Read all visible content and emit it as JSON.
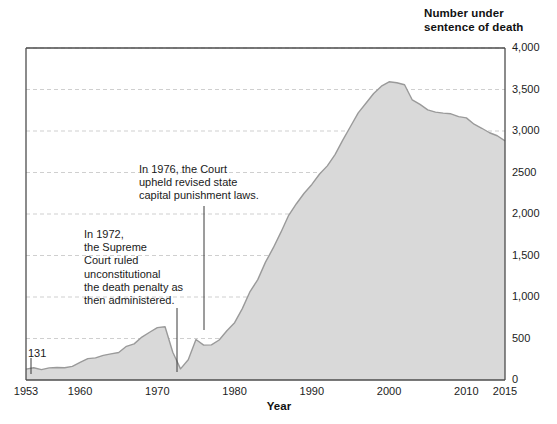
{
  "header": {
    "title": "Number under\nsentence of death"
  },
  "chart_data": {
    "type": "area",
    "title": "Number under sentence of death",
    "xlabel": "Year",
    "ylabel": "Number under sentence of death",
    "xlim": [
      1953,
      2015
    ],
    "ylim": [
      0,
      4000
    ],
    "grid": true,
    "legend": null,
    "x_ticks": [
      "1953",
      "1960",
      "1970",
      "1980",
      "1990",
      "2000",
      "2010",
      "2015"
    ],
    "x_tick_values": [
      1953,
      1960,
      1970,
      1980,
      1990,
      2000,
      2010,
      2015
    ],
    "y_ticks": [
      "0",
      "500",
      "1,000",
      "1,500",
      "2,000",
      "2500",
      "3,000",
      "3,500",
      "4,000"
    ],
    "y_tick_values": [
      0,
      500,
      1000,
      1500,
      2000,
      2500,
      3000,
      3500,
      4000
    ],
    "series_name": "Prisoners under sentence of death",
    "fill_color": "#d9d9d9",
    "line_color": "#9a9a9a",
    "x": [
      1953,
      1954,
      1955,
      1956,
      1957,
      1958,
      1959,
      1960,
      1961,
      1962,
      1963,
      1964,
      1965,
      1966,
      1967,
      1968,
      1969,
      1970,
      1971,
      1972,
      1973,
      1974,
      1975,
      1976,
      1977,
      1978,
      1979,
      1980,
      1981,
      1982,
      1983,
      1984,
      1985,
      1986,
      1987,
      1988,
      1989,
      1990,
      1991,
      1992,
      1993,
      1994,
      1995,
      1996,
      1997,
      1998,
      1999,
      2000,
      2001,
      2002,
      2003,
      2004,
      2005,
      2006,
      2007,
      2008,
      2009,
      2010,
      2011,
      2012,
      2013,
      2014,
      2015
    ],
    "values": [
      131,
      147,
      125,
      146,
      151,
      147,
      164,
      212,
      257,
      267,
      297,
      315,
      331,
      406,
      435,
      517,
      575,
      631,
      642,
      334,
      134,
      244,
      488,
      420,
      423,
      482,
      593,
      691,
      860,
      1066,
      1209,
      1420,
      1591,
      1781,
      1984,
      2124,
      2250,
      2356,
      2482,
      2580,
      2716,
      2890,
      3054,
      3219,
      3335,
      3452,
      3540,
      3593,
      3581,
      3557,
      3374,
      3320,
      3254,
      3228,
      3215,
      3207,
      3173,
      3158,
      3082,
      3033,
      2979,
      2943,
      2881
    ],
    "annotations": [
      {
        "id": "annotation-1972",
        "text": "In 1972,\nthe Supreme\nCourt ruled\nunconstitutional\nthe death penalty as\nthen administered.",
        "points_to_year": 1973
      },
      {
        "id": "annotation-1976",
        "text": "In 1976, the Court\nupheld revised state\ncapital punishment laws.",
        "points_to_year": 1976
      }
    ],
    "data_labels": [
      {
        "id": "point-label-131",
        "text": "131",
        "year": 1953,
        "value": 131
      }
    ]
  }
}
